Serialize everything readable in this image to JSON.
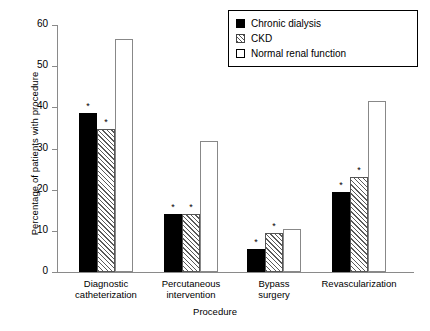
{
  "chart_data": {
    "type": "bar",
    "title": "",
    "xlabel": "Procedure",
    "ylabel": "Percentage of patients with procedure",
    "ylim": [
      0,
      60
    ],
    "yticks": [
      0,
      10,
      20,
      30,
      40,
      50,
      60
    ],
    "grid": false,
    "legend_position": "top-right",
    "categories": [
      "Diagnostic catheterization",
      "Percutaneous intervention",
      "Bypass surgery",
      "Revascularization"
    ],
    "category_lines": [
      [
        "Diagnostic",
        "catheterization"
      ],
      [
        "Percutaneous",
        "intervention"
      ],
      [
        "Bypass",
        "surgery"
      ],
      [
        "Revascularization"
      ]
    ],
    "series": [
      {
        "name": "Chronic dialysis",
        "fill": "solid-black",
        "values": [
          38.7,
          14.0,
          5.6,
          19.4
        ],
        "significance": [
          "*",
          "*",
          "*",
          "*"
        ]
      },
      {
        "name": "CKD",
        "fill": "hatched",
        "values": [
          34.8,
          14.1,
          9.5,
          23.0
        ],
        "significance": [
          "*",
          "*",
          "*",
          "*"
        ]
      },
      {
        "name": "Normal renal function",
        "fill": "open-white",
        "values": [
          56.6,
          31.9,
          10.5,
          41.6
        ],
        "significance": [
          "",
          "",
          "",
          ""
        ]
      }
    ],
    "annotation_note": "* denotes statistical significance versus normal renal function"
  },
  "legend": {
    "items": [
      {
        "label": "Chronic dialysis",
        "swatch": "solid-black-square-icon"
      },
      {
        "label": "CKD",
        "swatch": "hatched-square-icon"
      },
      {
        "label": "Normal renal function",
        "swatch": "open-square-icon"
      }
    ]
  },
  "axis": {
    "y_tick_labels": [
      "0",
      "10",
      "20",
      "30",
      "40",
      "50",
      "60"
    ],
    "y_title": "Percentage of patients with procedure",
    "x_title": "Procedure"
  },
  "colors": {
    "series_1": "#000000",
    "series_2_hatch": "#555555",
    "series_3": "#ffffff",
    "axis": "#8a8a8a",
    "text": "#000000",
    "background": "#ffffff"
  }
}
